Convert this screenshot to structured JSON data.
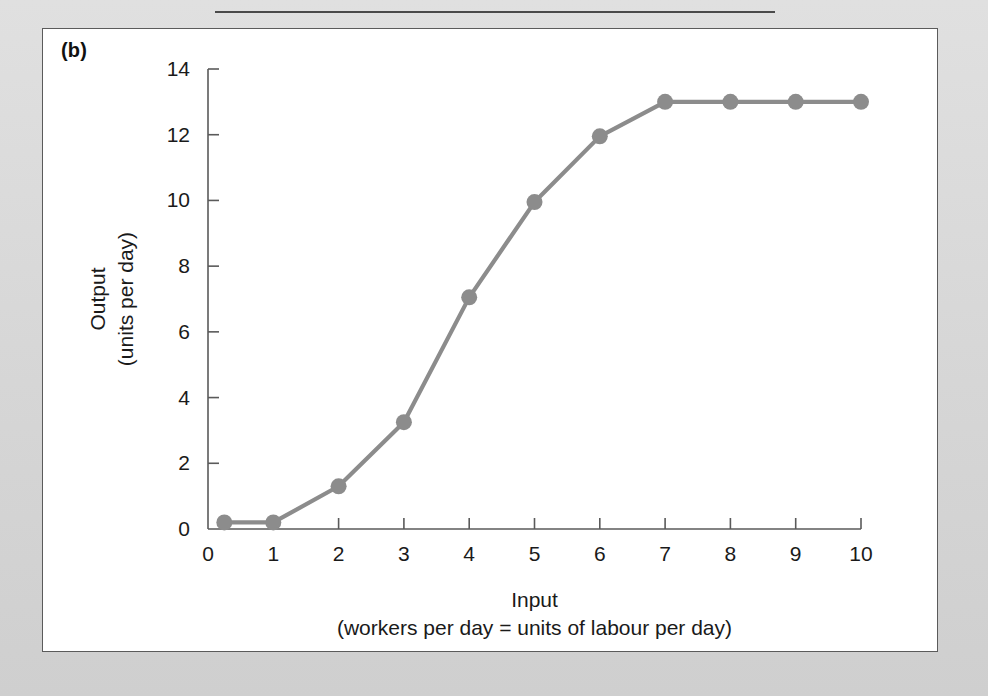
{
  "figure": {
    "panel_label": "(b)",
    "background_color": "#d9d9d9",
    "panel_color": "#ffffff",
    "border_color": "#5b5b5b"
  },
  "chart_data": {
    "type": "line",
    "title": "",
    "subtitle": "",
    "xlabel": "Input",
    "xlabel_sub": "(workers per day = units of labour per day)",
    "ylabel": "Output",
    "ylabel_sub": "(units per day)",
    "xlim": [
      0,
      10
    ],
    "ylim": [
      0,
      14
    ],
    "xticks": [
      0,
      1,
      2,
      3,
      4,
      5,
      6,
      7,
      8,
      9,
      10
    ],
    "xtick_labels": [
      "0",
      "1",
      "2",
      "3",
      "4",
      "5",
      "6",
      "7",
      "8",
      "9",
      "10"
    ],
    "yticks": [
      0,
      2,
      4,
      6,
      8,
      10,
      12,
      14
    ],
    "ytick_labels": [
      "0",
      "2",
      "4",
      "6",
      "8",
      "10",
      "12",
      "14"
    ],
    "grid": false,
    "legend": false,
    "series_color": "#8c8c8c",
    "marker": "circle",
    "marker_size": 11,
    "x": [
      0.25,
      1,
      2,
      3,
      4,
      5,
      6,
      7,
      8,
      9,
      10
    ],
    "values": [
      0.2,
      0.2,
      1.3,
      3.25,
      7.05,
      9.95,
      11.95,
      13,
      13,
      13,
      13
    ],
    "series": [
      {
        "name": "Total product",
        "values": [
          0.2,
          0.2,
          1.3,
          3.25,
          7.05,
          9.95,
          11.95,
          13,
          13,
          13,
          13
        ]
      }
    ]
  }
}
